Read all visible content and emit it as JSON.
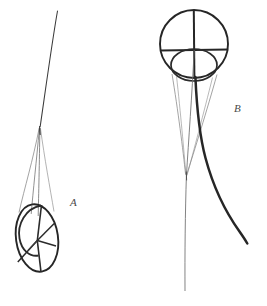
{
  "figure": {
    "background_color": "#ffffff",
    "width": 267,
    "height": 306,
    "stroke_colors": {
      "heavy": "#262626",
      "medium": "#3a3a3a",
      "light": "#6d6d6d",
      "hairline": "#8a8a8a",
      "label": "#4a4a4a"
    },
    "stroke_widths": {
      "heavy": 2.4,
      "medium": 1.5,
      "light": 0.8,
      "hairline": 0.6
    },
    "panels": [
      {
        "id": "panel-a",
        "label": "A",
        "label_position": {
          "x": 70,
          "y": 196
        },
        "description": "Slender upward line tapering to a narrow apex, with fine guide lines fanning down into a small outlined ellipse that is divided by radiating chords.",
        "apex": {
          "x": 39,
          "y": 128
        },
        "top_of_long_line": {
          "x": 57,
          "y": 11
        },
        "ellipse": {
          "center_x": 37,
          "center_y": 238,
          "radius_x": 21,
          "radius_y": 34,
          "rotation_deg": -8
        },
        "inner_arc_note": "Secondary arc inside the ellipse, open toward lower right",
        "radiating_chords": 5
      },
      {
        "id": "panel-b",
        "label": "B",
        "label_position": {
          "x": 234,
          "y": 102
        },
        "description": "Large circle crossed by a vertical and a horizontal diameter, with a smaller ellipse tucked into its lower half; a heavy curve sweeps down and right while fine guide lines converge below.",
        "circle": {
          "center_x": 194,
          "center_y": 44,
          "radius": 34
        },
        "vertical_diameter": {
          "x": 194,
          "y_top": 10,
          "y_bottom": 78
        },
        "horizontal_diameter": {
          "y": 50,
          "x_left": 161,
          "x_right": 228
        },
        "inner_ellipse": {
          "center_x": 194,
          "center_y": 65,
          "radius_x": 23,
          "radius_y": 16
        },
        "convergence_point": {
          "x": 186,
          "y": 175
        },
        "heavy_curve": {
          "start": {
            "x": 196,
            "y": 78
          },
          "end": {
            "x": 247,
            "y": 243
          }
        },
        "long_tail": {
          "start": {
            "x": 194,
            "y": 50
          },
          "end": {
            "x": 185,
            "y": 290
          }
        }
      }
    ]
  }
}
